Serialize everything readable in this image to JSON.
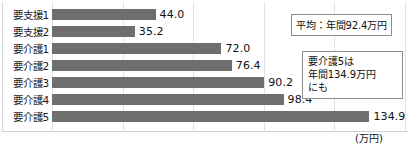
{
  "chart_data": {
    "type": "bar",
    "orientation": "horizontal",
    "title": "",
    "xlabel": "(万円)",
    "ylabel": "",
    "categories": [
      "要支援1",
      "要支援2",
      "要介護1",
      "要介護2",
      "要介護3",
      "要介護4",
      "要介護5"
    ],
    "values": [
      44.0,
      35.2,
      72.0,
      76.4,
      90.2,
      98.4,
      134.9
    ],
    "value_labels": [
      "44.0",
      "35.2",
      "72.0",
      "76.4",
      "90.2",
      "98.4",
      "134.9"
    ],
    "xlim": [
      0,
      150
    ],
    "grid": true,
    "grid_interval": 30,
    "legend": "none",
    "bar_color": "#6e6e6e",
    "annotations": [
      {
        "name": "average",
        "text": "平均：年間92.4万円",
        "value": 92.4
      },
      {
        "name": "highlight",
        "lines": [
          "要介護5は",
          "年間134.9万円",
          "にも"
        ],
        "value": 134.9
      }
    ]
  },
  "unit": {
    "label": "(万円)"
  }
}
